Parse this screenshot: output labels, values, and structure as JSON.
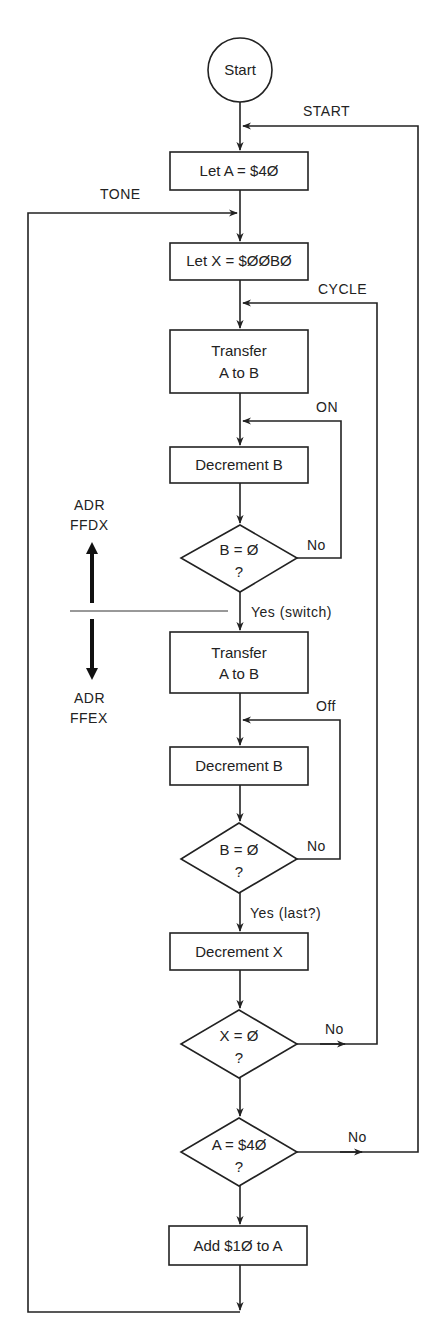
{
  "diagram": {
    "type": "flowchart",
    "nodes": {
      "start": {
        "label": "Start",
        "shape": "circle"
      },
      "let_a": {
        "label": "Let A = $4Ø",
        "shape": "process"
      },
      "let_x": {
        "label": "Let X = $ØØBØ",
        "shape": "process"
      },
      "transfer1": {
        "line1": "Transfer",
        "line2": "A to B",
        "shape": "process"
      },
      "dec_b1": {
        "label": "Decrement B",
        "shape": "process"
      },
      "check_b1": {
        "line1": "B = Ø",
        "line2": "?",
        "shape": "decision"
      },
      "transfer2": {
        "line1": "Transfer",
        "line2": "A to B",
        "shape": "process"
      },
      "dec_b2": {
        "label": "Decrement B",
        "shape": "process"
      },
      "check_b2": {
        "line1": "B = Ø",
        "line2": "?",
        "shape": "decision"
      },
      "dec_x": {
        "label": "Decrement X",
        "shape": "process"
      },
      "check_x": {
        "line1": "X = Ø",
        "line2": "?",
        "shape": "decision"
      },
      "check_a": {
        "line1": "A = $4Ø",
        "line2": "?",
        "shape": "decision"
      },
      "add_a": {
        "label": "Add $1Ø to A",
        "shape": "process"
      }
    },
    "labels": {
      "start_loop": "START",
      "tone_loop": "TONE",
      "cycle_loop": "CYCLE",
      "on_loop": "ON",
      "off_loop": "Off",
      "no1": "No",
      "yes_switch": "Yes (switch)",
      "no2": "No",
      "yes_last": "Yes (last?)",
      "no3": "No",
      "no4": "No",
      "adr_up_1": "ADR",
      "adr_up_2": "FFDX",
      "adr_down_1": "ADR",
      "adr_down_2": "FFEX"
    },
    "edges": [
      {
        "from": "start",
        "to": "let_a"
      },
      {
        "from": "let_a",
        "to": "let_x"
      },
      {
        "from": "let_x",
        "to": "transfer1"
      },
      {
        "from": "transfer1",
        "to": "dec_b1"
      },
      {
        "from": "dec_b1",
        "to": "check_b1"
      },
      {
        "from": "check_b1",
        "to": "dec_b1",
        "label": "No",
        "loop": "ON"
      },
      {
        "from": "check_b1",
        "to": "transfer2",
        "label": "Yes (switch)"
      },
      {
        "from": "transfer2",
        "to": "dec_b2"
      },
      {
        "from": "dec_b2",
        "to": "check_b2"
      },
      {
        "from": "check_b2",
        "to": "dec_b2",
        "label": "No",
        "loop": "Off"
      },
      {
        "from": "check_b2",
        "to": "dec_x",
        "label": "Yes (last?)"
      },
      {
        "from": "dec_x",
        "to": "check_x"
      },
      {
        "from": "check_x",
        "to": "transfer1",
        "label": "No",
        "loop": "CYCLE"
      },
      {
        "from": "check_x",
        "to": "check_a"
      },
      {
        "from": "check_a",
        "to": "let_a",
        "label": "No",
        "loop": "START"
      },
      {
        "from": "check_a",
        "to": "add_a"
      },
      {
        "from": "add_a",
        "to": "let_x",
        "loop": "TONE"
      }
    ]
  }
}
